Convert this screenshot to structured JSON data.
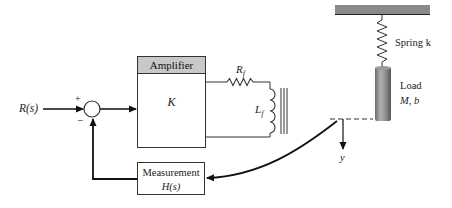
{
  "diagram": {
    "type": "feedback control block diagram",
    "input": {
      "label": "R(s)"
    },
    "summing_junction": {
      "plus_sign": "+",
      "minus_sign": "−"
    },
    "amplifier": {
      "title": "Amplifier",
      "gain": "K"
    },
    "field_circuit": {
      "resistor": "R",
      "resistor_sub": "f",
      "inductor": "L",
      "inductor_sub": "f"
    },
    "mechanical": {
      "spring_label": "Spring k",
      "load_label": "Load",
      "load_params": "M, b",
      "output_label": "y"
    },
    "measurement": {
      "title": "Measurement",
      "transfer": "H(s)"
    },
    "colors": {
      "line": "#222222",
      "amplifier_header": "#c8c8c8",
      "ceiling": "#8a8a8a",
      "load": "#7a7a7a"
    }
  }
}
